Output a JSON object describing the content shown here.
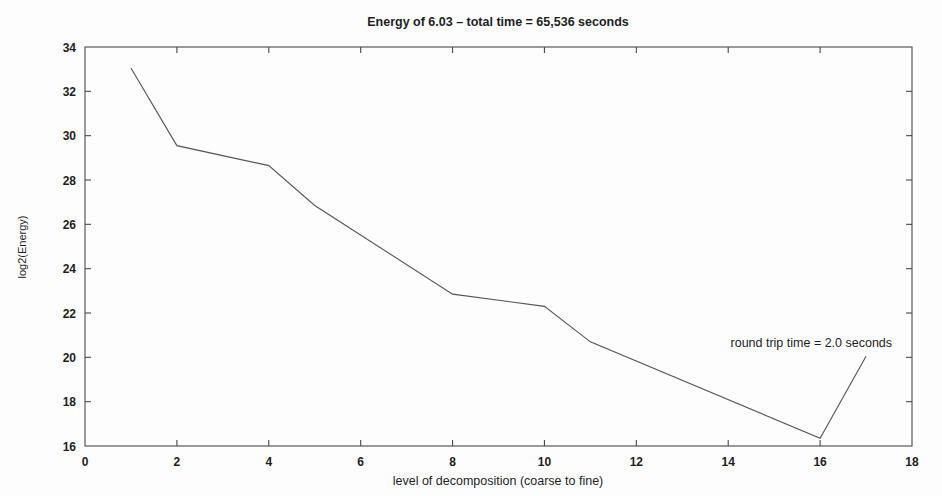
{
  "chart_data": {
    "type": "line",
    "title": "Energy of 6.03 – total time = 65,536 seconds",
    "xlabel": "level of decomposition (coarse to fine)",
    "ylabel": "log2(Energy)",
    "xlim": [
      0,
      18
    ],
    "ylim": [
      16,
      34
    ],
    "xticks": [
      0,
      2,
      4,
      6,
      8,
      10,
      12,
      14,
      16,
      18
    ],
    "yticks": [
      16,
      18,
      20,
      22,
      24,
      26,
      28,
      30,
      32,
      34
    ],
    "xtick_labels": [
      "0",
      "2",
      "4",
      "6",
      "8",
      "10",
      "12",
      "14",
      "16",
      "18"
    ],
    "ytick_labels": [
      "16",
      "18",
      "20",
      "22",
      "24",
      "26",
      "28",
      "30",
      "32",
      "34"
    ],
    "grid": false,
    "legend": false,
    "series": [
      {
        "name": "log2(Energy) vs level",
        "color": "#555555",
        "x": [
          1,
          2,
          4,
          5,
          8,
          10,
          11,
          16,
          17
        ],
        "values": [
          33.05,
          29.55,
          28.65,
          26.85,
          22.85,
          22.3,
          20.7,
          16.35,
          20.05
        ]
      }
    ],
    "annotations": [
      {
        "text": "round trip time = 2.0 seconds",
        "x": 14.05,
        "y": 20.45
      }
    ]
  },
  "figure": {
    "line_color": "#555555",
    "axis_color": "#4a4a4a",
    "background": "#fdfdfd",
    "text_color": "#1d1d1d"
  }
}
